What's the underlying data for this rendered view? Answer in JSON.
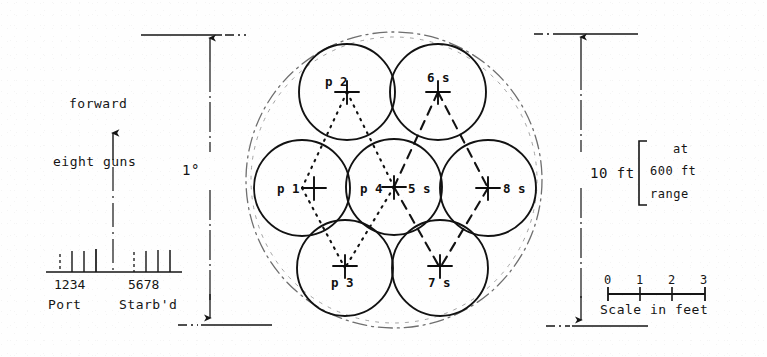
{
  "diagram": {
    "left_panel": {
      "forward_label": "forward",
      "eight_guns_label": "eight guns",
      "port_label": "Port",
      "starboard_label": "Starb'd",
      "port_gun_numbers": [
        "1",
        "2",
        "3",
        "4"
      ],
      "starboard_gun_numbers": [
        "5",
        "6",
        "7",
        "8"
      ],
      "port_numbers_text": "1234",
      "starboard_numbers_text": "5678"
    },
    "dimensions": {
      "angular_label": "1°",
      "linear_label": "10 ft",
      "range_note_line1": "at",
      "range_note_line2": "600 ft",
      "range_note_line3": "range"
    },
    "scale_bar": {
      "caption": "Scale in feet",
      "ticks": [
        "0",
        "1",
        "2",
        "3"
      ]
    },
    "pattern": {
      "circles": [
        {
          "id": "p2",
          "label": "p 2",
          "label_side": "left",
          "cx": 347,
          "cy": 92,
          "r": 48,
          "group": "port"
        },
        {
          "id": "s6",
          "label": "6 s",
          "label_side": "above",
          "cx": 438,
          "cy": 92,
          "r": 48,
          "group": "starboard"
        },
        {
          "id": "p1",
          "label": "p 1",
          "label_side": "left",
          "cx": 302,
          "cy": 188,
          "r": 48,
          "group": "port"
        },
        {
          "id": "p4",
          "label": "p 4",
          "label_side": "left",
          "cx": 394,
          "cy": 187,
          "r": 48,
          "group": "port"
        },
        {
          "id": "s5",
          "label": "5 s",
          "label_side": "right",
          "cx": 394,
          "cy": 187,
          "r": 48,
          "group": "starboard"
        },
        {
          "id": "s8",
          "label": "8 s",
          "label_side": "right",
          "cx": 488,
          "cy": 188,
          "r": 48,
          "group": "starboard"
        },
        {
          "id": "p3",
          "label": "p 3",
          "label_side": "below",
          "cx": 345,
          "cy": 268,
          "r": 48,
          "group": "port"
        },
        {
          "id": "s7",
          "label": "7 s",
          "label_side": "below",
          "cx": 440,
          "cy": 268,
          "r": 48,
          "group": "starboard"
        }
      ],
      "enclosing_circle": {
        "cx": 394,
        "cy": 180,
        "r": 148
      },
      "port_pattern_style": "dotted",
      "starboard_pattern_style": "dashed"
    },
    "colors": {
      "ink": "#151515",
      "paper": "#fefefe",
      "faint": "#8a8a8a"
    }
  }
}
